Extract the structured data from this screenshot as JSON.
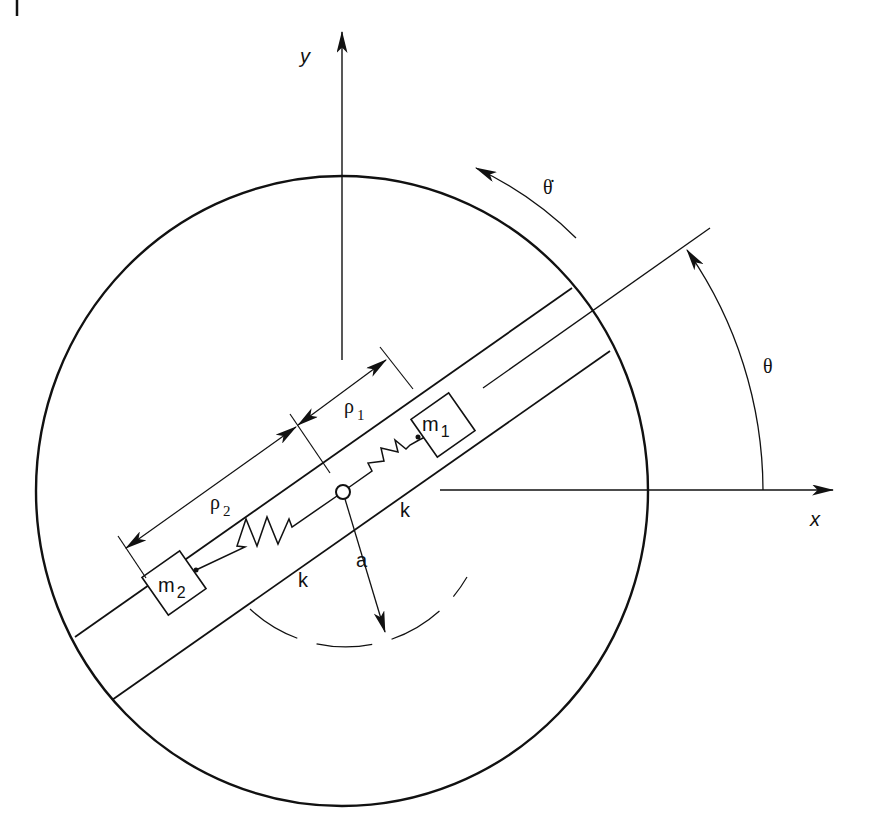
{
  "diagram": {
    "type": "mechanical-schematic",
    "colors": {
      "stroke": "#111111",
      "background": "#ffffff"
    },
    "axes": {
      "x_label": "x",
      "y_label": "y"
    },
    "angle": {
      "theta_label": "θ",
      "theta_dot_label": "θ̇"
    },
    "masses": [
      {
        "id": "m1",
        "label": "m",
        "subscript": "1"
      },
      {
        "id": "m2",
        "label": "m",
        "subscript": "2"
      }
    ],
    "springs": [
      {
        "id": "spring-1",
        "label": "k"
      },
      {
        "id": "spring-2",
        "label": "k"
      }
    ],
    "dimensions": [
      {
        "id": "rho1",
        "label": "ρ",
        "subscript": "1"
      },
      {
        "id": "rho2",
        "label": "ρ",
        "subscript": "2"
      },
      {
        "id": "radius-a",
        "label": "a"
      }
    ]
  }
}
